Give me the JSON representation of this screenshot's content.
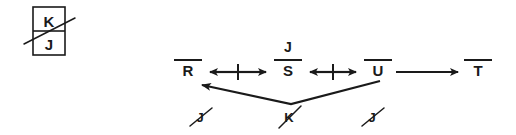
{
  "figure": {
    "title": "",
    "background_color": "#ffffff",
    "ink_color": "#1a1a1a"
  },
  "key_box": {
    "name": "legend-box",
    "top_label": "K",
    "bottom_label": "J",
    "strikethrough": true
  },
  "nodes": [
    {
      "id": "R",
      "label": "R",
      "overbar": true,
      "x": 188,
      "y": 76
    },
    {
      "id": "S",
      "label": "S",
      "overbar": true,
      "x": 288,
      "y": 76
    },
    {
      "id": "U",
      "label": "U",
      "overbar": true,
      "x": 378,
      "y": 76
    },
    {
      "id": "T",
      "label": "T",
      "overbar": true,
      "x": 478,
      "y": 76
    }
  ],
  "superscript": {
    "label": "J",
    "overbar": true,
    "above_node": "S",
    "x": 288,
    "y": 55
  },
  "connectors": [
    {
      "id": "R-S",
      "from": "R",
      "to": "S",
      "style": "double-headed",
      "center_tick": true
    },
    {
      "id": "S-U",
      "from": "S",
      "to": "U",
      "style": "double-headed",
      "center_tick": true
    },
    {
      "id": "U-T",
      "from": "U",
      "to": "T",
      "style": "single-headed-right",
      "center_tick": false
    },
    {
      "id": "U-R-via-K",
      "from": "U",
      "to": "R",
      "style": "bent-arrow-below",
      "center_tick": false,
      "vertex_label": "K"
    }
  ],
  "bottom_marks": [
    {
      "id": "mark-left",
      "label": "J",
      "strikethrough": true,
      "x": 200,
      "y": 118
    },
    {
      "id": "mark-center",
      "label": "K",
      "strikethrough": true,
      "x": 288,
      "y": 118
    },
    {
      "id": "mark-right",
      "label": "J",
      "strikethrough": true,
      "x": 372,
      "y": 118
    }
  ]
}
